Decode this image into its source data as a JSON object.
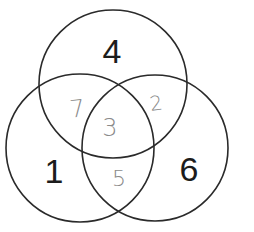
{
  "diagram": {
    "type": "venn",
    "set_count": 3,
    "colors": {
      "outline": "#2a2a2a",
      "printed_number": "#1c1c1c",
      "handwritten_number": "#8a8a8a"
    },
    "sets": [
      {
        "id": "top",
        "name": "top-circle"
      },
      {
        "id": "left",
        "name": "left-circle"
      },
      {
        "id": "right",
        "name": "right-circle"
      }
    ],
    "regions": [
      {
        "id": "top_only",
        "sets": [
          "top"
        ],
        "label": "4",
        "style": "printed"
      },
      {
        "id": "left_only",
        "sets": [
          "left"
        ],
        "label": "1",
        "style": "printed"
      },
      {
        "id": "right_only",
        "sets": [
          "right"
        ],
        "label": "6",
        "style": "printed"
      },
      {
        "id": "top_left",
        "sets": [
          "top",
          "left"
        ],
        "label": "7",
        "style": "handwritten"
      },
      {
        "id": "top_right",
        "sets": [
          "top",
          "right"
        ],
        "label": "2",
        "style": "handwritten"
      },
      {
        "id": "left_right",
        "sets": [
          "left",
          "right"
        ],
        "label": "5",
        "style": "handwritten"
      },
      {
        "id": "all_three",
        "sets": [
          "top",
          "left",
          "right"
        ],
        "label": "3",
        "style": "handwritten"
      }
    ]
  }
}
